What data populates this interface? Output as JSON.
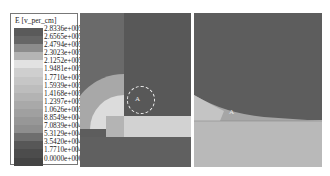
{
  "legend": {
    "title": "E [v_per_cm]",
    "entries": [
      {
        "label": "2.8336e+005",
        "color": "#5a5a5a"
      },
      {
        "label": "2.6565e+005",
        "color": "#666666"
      },
      {
        "label": "2.4794e+005",
        "color": "#8c8c8c"
      },
      {
        "label": "2.3023e+005",
        "color": "#b4b4b4"
      },
      {
        "label": "2.1252e+005",
        "color": "#e2e2e2"
      },
      {
        "label": "1.9481e+005",
        "color": "#cfcfcf"
      },
      {
        "label": "1.7710e+005",
        "color": "#c6c6c6"
      },
      {
        "label": "1.5939e+005",
        "color": "#bdbdbd"
      },
      {
        "label": "1.4168e+005",
        "color": "#b3b3b3"
      },
      {
        "label": "1.2397e+005",
        "color": "#a9a9a9"
      },
      {
        "label": "1.0626e+005",
        "color": "#a0a0a0"
      },
      {
        "label": "8.8549e+004",
        "color": "#979797"
      },
      {
        "label": "7.0839e+004",
        "color": "#8e8e8e"
      },
      {
        "label": "5.3129e+004",
        "color": "#6e6e6e"
      },
      {
        "label": "3.5420e+004",
        "color": "#575757"
      },
      {
        "label": "1.7710e+004",
        "color": "#4c4c4c"
      },
      {
        "label": "0.0000e+000",
        "color": "#444444"
      }
    ]
  },
  "panels": {
    "left": {
      "marker": "A"
    },
    "right": {
      "marker": "A"
    }
  }
}
